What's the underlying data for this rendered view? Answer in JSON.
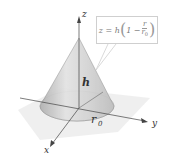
{
  "figure": {
    "type": "3d-surface",
    "axes": {
      "x_label": "x",
      "y_label": "y",
      "z_label": "z"
    },
    "labels": {
      "height": "h",
      "radius": "r",
      "radius_subscript": "0"
    },
    "equation": {
      "lhs": "z = h",
      "inner_prefix": "1 −",
      "fraction_numerator": "r",
      "fraction_denominator": "r",
      "fraction_denominator_subscript": "0"
    },
    "colors": {
      "cone_fill": "#d4d4d4",
      "cone_shade": "#a8a8a8",
      "plane": "#e8e8e8",
      "axis": "#444444"
    }
  }
}
